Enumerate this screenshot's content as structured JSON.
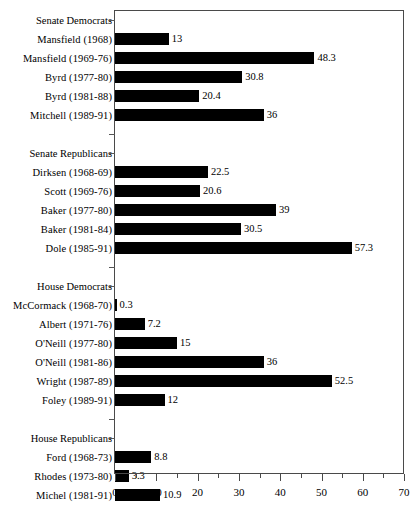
{
  "chart_data": {
    "type": "bar",
    "orientation": "horizontal",
    "title": "",
    "subtitle": "",
    "xlabel": "",
    "ylabel": "",
    "xlim": [
      0,
      70
    ],
    "grid": false,
    "legend": null,
    "bar_color": "#000000",
    "axis_color": "#4a4a4a",
    "x_major_ticks": [
      0,
      10,
      20,
      30,
      40,
      50,
      60,
      70
    ],
    "x_minor_ticks": [
      5,
      15,
      25,
      35,
      45,
      55,
      65
    ],
    "x_tick_labels": [
      "0",
      "10",
      "20",
      "30",
      "40",
      "50",
      "60",
      "70"
    ],
    "groups": [
      {
        "name": "Senate Democrats",
        "categories": [
          "Mansfield (1968)",
          "Mansfield (1969-76)",
          "Byrd (1977-80)",
          "Byrd (1981-88)",
          "Mitchell (1989-91)"
        ],
        "values": [
          13,
          48.3,
          30.8,
          20.4,
          36
        ],
        "value_labels": [
          "13",
          "48.3",
          "30.8",
          "20.4",
          "36"
        ]
      },
      {
        "name": "Senate Republicans",
        "categories": [
          "Dirksen (1968-69)",
          "Scott (1969-76)",
          "Baker (1977-80)",
          "Baker (1981-84)",
          "Dole (1985-91)"
        ],
        "values": [
          22.5,
          20.6,
          39,
          30.5,
          57.3
        ],
        "value_labels": [
          "22.5",
          "20.6",
          "39",
          "30.5",
          "57.3"
        ]
      },
      {
        "name": "House Democrats",
        "categories": [
          "McCormack (1968-70)",
          "Albert (1971-76)",
          "O'Neill (1977-80)",
          "O'Neill (1981-86)",
          "Wright (1987-89)",
          "Foley (1989-91)"
        ],
        "values": [
          0.3,
          7.2,
          15,
          36,
          52.5,
          12
        ],
        "value_labels": [
          "0.3",
          "7.2",
          "15",
          "36",
          "52.5",
          "12"
        ]
      },
      {
        "name": "House Republicans",
        "categories": [
          "Ford (1968-73)",
          "Rhodes (1973-80)",
          "Michel (1981-91)"
        ],
        "values": [
          8.8,
          3.3,
          10.9
        ],
        "value_labels": [
          "8.8",
          "3.3",
          "10.9"
        ]
      }
    ],
    "categories": [
      "Mansfield (1968)",
      "Mansfield (1969-76)",
      "Byrd (1977-80)",
      "Byrd (1981-88)",
      "Mitchell (1989-91)",
      "Dirksen (1968-69)",
      "Scott (1969-76)",
      "Baker (1977-80)",
      "Baker (1981-84)",
      "Dole (1985-91)",
      "McCormack (1968-70)",
      "Albert (1971-76)",
      "O'Neill (1977-80)",
      "O'Neill (1981-86)",
      "Wright (1987-89)",
      "Foley (1989-91)",
      "Ford (1968-73)",
      "Rhodes (1973-80)",
      "Michel (1981-91)"
    ],
    "values": [
      13,
      48.3,
      30.8,
      20.4,
      36,
      22.5,
      20.6,
      39,
      30.5,
      57.3,
      0.3,
      7.2,
      15,
      36,
      52.5,
      12,
      8.8,
      3.3,
      10.9
    ]
  },
  "rows": [
    {
      "kind": "group",
      "label": "Senate Democrats"
    },
    {
      "kind": "bar",
      "label": "Mansfield (1968)",
      "value": 13,
      "value_label": "13"
    },
    {
      "kind": "bar",
      "label": "Mansfield (1969-76)",
      "value": 48.3,
      "value_label": "48.3"
    },
    {
      "kind": "bar",
      "label": "Byrd (1977-80)",
      "value": 30.8,
      "value_label": "30.8"
    },
    {
      "kind": "bar",
      "label": "Byrd (1981-88)",
      "value": 20.4,
      "value_label": "20.4"
    },
    {
      "kind": "bar",
      "label": "Mitchell (1989-91)",
      "value": 36,
      "value_label": "36"
    },
    {
      "kind": "blank",
      "label": ""
    },
    {
      "kind": "group",
      "label": "Senate Republicans"
    },
    {
      "kind": "bar",
      "label": "Dirksen (1968-69)",
      "value": 22.5,
      "value_label": "22.5"
    },
    {
      "kind": "bar",
      "label": "Scott (1969-76)",
      "value": 20.6,
      "value_label": "20.6"
    },
    {
      "kind": "bar",
      "label": "Baker (1977-80)",
      "value": 39,
      "value_label": "39"
    },
    {
      "kind": "bar",
      "label": "Baker (1981-84)",
      "value": 30.5,
      "value_label": "30.5"
    },
    {
      "kind": "bar",
      "label": "Dole (1985-91)",
      "value": 57.3,
      "value_label": "57.3"
    },
    {
      "kind": "blank",
      "label": ""
    },
    {
      "kind": "group",
      "label": "House Democrats"
    },
    {
      "kind": "bar",
      "label": "McCormack (1968-70)",
      "value": 0.3,
      "value_label": "0.3"
    },
    {
      "kind": "bar",
      "label": "Albert (1971-76)",
      "value": 7.2,
      "value_label": "7.2"
    },
    {
      "kind": "bar",
      "label": "O'Neill (1977-80)",
      "value": 15,
      "value_label": "15"
    },
    {
      "kind": "bar",
      "label": "O'Neill (1981-86)",
      "value": 36,
      "value_label": "36"
    },
    {
      "kind": "bar",
      "label": "Wright (1987-89)",
      "value": 52.5,
      "value_label": "52.5"
    },
    {
      "kind": "bar",
      "label": "Foley (1989-91)",
      "value": 12,
      "value_label": "12"
    },
    {
      "kind": "blank",
      "label": ""
    },
    {
      "kind": "group",
      "label": "House Republicans"
    },
    {
      "kind": "bar",
      "label": "Ford (1968-73)",
      "value": 8.8,
      "value_label": "8.8"
    },
    {
      "kind": "bar",
      "label": "Rhodes (1973-80)",
      "value": 3.3,
      "value_label": "3.3"
    },
    {
      "kind": "bar",
      "label": "Michel (1981-91)",
      "value": 10.9,
      "value_label": "10.9"
    }
  ]
}
